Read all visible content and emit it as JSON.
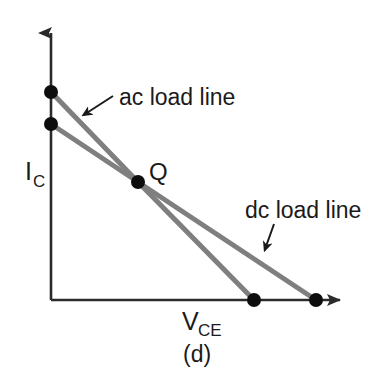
{
  "figure": {
    "caption": "(d)",
    "width": 372,
    "height": 380,
    "background_color": "#ffffff"
  },
  "axes": {
    "y_axis": {
      "label_main": "I",
      "label_subscript": "C",
      "label_full": "IC",
      "color": "#2b2b2b",
      "origin_x": 51,
      "top_y": 27,
      "bottom_y": 300
    },
    "x_axis": {
      "label_main": "V",
      "label_subscript": "CE",
      "label_full": "VCE",
      "color": "#2b2b2b",
      "origin_y": 300,
      "left_x": 51,
      "right_x": 352
    }
  },
  "annotations": [
    {
      "id": "ac-load-line-annotation",
      "text": "ac load line",
      "text_x": 114,
      "text_y": 104,
      "arrow_from_x": 113,
      "arrow_from_y": 96,
      "arrow_to_x": 79,
      "arrow_to_y": 118
    },
    {
      "id": "dc-load-line-annotation",
      "text": "dc load line",
      "text_x": 245,
      "text_y": 217,
      "arrow_from_x": 274,
      "arrow_from_y": 224,
      "arrow_to_x": 263,
      "arrow_to_y": 255
    }
  ],
  "q_point": {
    "label": "Q",
    "x": 138,
    "y": 182,
    "label_x": 149,
    "label_y": 179
  },
  "chart_data": {
    "type": "line",
    "title": "",
    "subtitle": "",
    "xlabel": "VCE",
    "ylabel": "IC",
    "caption": "(d)",
    "grid": false,
    "legend_position": "inline-annotations",
    "line_color": "#7f7f7f",
    "marker_color": "#0d0d0d",
    "marker_radius": 7,
    "line_width": 5,
    "axis_color": "#2b2b2b",
    "xlim": [
      0,
      1
    ],
    "ylim": [
      0,
      1
    ],
    "series": [
      {
        "name": "ac load line",
        "description": "Steeper line: higher IC intercept, lower VCE intercept, passing through Q",
        "points_px": [
          [
            51,
            92
          ],
          [
            138,
            182
          ],
          [
            254,
            300
          ]
        ],
        "y_intercept_px": [
          51,
          92
        ],
        "x_intercept_px": [
          254,
          300
        ],
        "markers": [
          [
            51,
            92
          ],
          [
            138,
            182
          ],
          [
            254,
            300
          ]
        ]
      },
      {
        "name": "dc load line",
        "description": "Shallower line: lower IC intercept, higher VCE intercept, passing through Q",
        "points_px": [
          [
            51,
            124
          ],
          [
            138,
            182
          ],
          [
            316,
            300
          ]
        ],
        "y_intercept_px": [
          51,
          124
        ],
        "x_intercept_px": [
          316,
          300
        ],
        "markers": [
          [
            51,
            124
          ],
          [
            138,
            182
          ],
          [
            316,
            300
          ]
        ]
      }
    ],
    "annotations": [
      {
        "text": "ac load line",
        "target": "ac load line"
      },
      {
        "text": "dc load line",
        "target": "dc load line"
      },
      {
        "text": "Q",
        "target": "quiescent operating point"
      }
    ]
  }
}
